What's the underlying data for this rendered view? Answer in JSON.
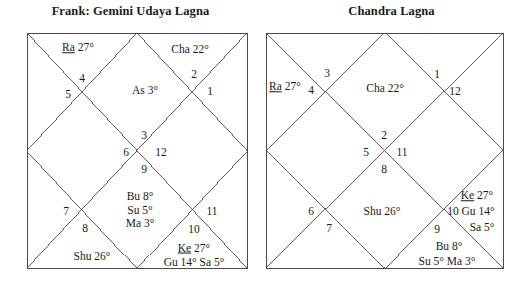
{
  "page": {
    "background": "#ffffff",
    "line_color": "#4a4a4a",
    "text_color": "#1a1a1a"
  },
  "charts": [
    {
      "id": "frank-gemini-udaya-lagna",
      "title": "Frank: Gemini Udaya Lagna",
      "box": {
        "x": 27,
        "y": 33,
        "w": 220,
        "h": 235
      },
      "house_numbers": [
        {
          "n": "4",
          "x": 82,
          "y": 78
        },
        {
          "n": "5",
          "x": 68,
          "y": 94
        },
        {
          "n": "2",
          "x": 194,
          "y": 74
        },
        {
          "n": "1",
          "x": 210,
          "y": 91
        },
        {
          "n": "3",
          "x": 144,
          "y": 135
        },
        {
          "n": "6",
          "x": 126,
          "y": 152
        },
        {
          "n": "12",
          "x": 161,
          "y": 152
        },
        {
          "n": "9",
          "x": 144,
          "y": 169
        },
        {
          "n": "7",
          "x": 66,
          "y": 211
        },
        {
          "n": "8",
          "x": 85,
          "y": 228
        },
        {
          "n": "11",
          "x": 212,
          "y": 211
        },
        {
          "n": "10",
          "x": 194,
          "y": 229
        }
      ],
      "planet_labels": [
        {
          "key": "ra",
          "lines": [
            "Ra 27°"
          ],
          "underline_first_word": true,
          "x": 78,
          "y": 48,
          "align": "center"
        },
        {
          "key": "cha",
          "lines": [
            "Cha 22°"
          ],
          "underline_first_word": false,
          "x": 190,
          "y": 50,
          "align": "center"
        },
        {
          "key": "as",
          "lines": [
            "As 3°"
          ],
          "underline_first_word": false,
          "x": 145,
          "y": 91,
          "align": "center"
        },
        {
          "key": "bu_su_ma",
          "lines": [
            "Bu 8°",
            "Su 5°",
            "Ma 3°"
          ],
          "underline_first_word": false,
          "x": 140,
          "y": 210,
          "align": "center"
        },
        {
          "key": "shu",
          "lines": [
            "Shu 26°"
          ],
          "underline_first_word": false,
          "x": 92,
          "y": 257,
          "align": "center"
        },
        {
          "key": "ke_gu_sa",
          "lines": [
            "Ke 27°",
            "Gu 14° Sa 5°"
          ],
          "underline_first_word": true,
          "x": 194,
          "y": 255,
          "align": "center"
        }
      ]
    },
    {
      "id": "chandra-lagna",
      "title": "Chandra Lagna",
      "box": {
        "x": 5,
        "y": 33,
        "w": 237,
        "h": 235
      },
      "house_numbers": [
        {
          "n": "3",
          "x": 66,
          "y": 73
        },
        {
          "n": "4",
          "x": 50,
          "y": 90
        },
        {
          "n": "1",
          "x": 176,
          "y": 74
        },
        {
          "n": "12",
          "x": 194,
          "y": 91
        },
        {
          "n": "2",
          "x": 123,
          "y": 135
        },
        {
          "n": "5",
          "x": 105,
          "y": 152
        },
        {
          "n": "11",
          "x": 141,
          "y": 152
        },
        {
          "n": "8",
          "x": 123,
          "y": 169
        },
        {
          "n": "6",
          "x": 50,
          "y": 211
        },
        {
          "n": "7",
          "x": 68,
          "y": 228
        },
        {
          "n": "10",
          "x": 192,
          "y": 211
        },
        {
          "n": "9",
          "x": 176,
          "y": 229
        }
      ],
      "planet_labels": [
        {
          "key": "ra",
          "lines": [
            "Ra 27°"
          ],
          "underline_first_word": true,
          "x": 8,
          "y": 87,
          "align": "left"
        },
        {
          "key": "cha",
          "lines": [
            "Cha 22°"
          ],
          "underline_first_word": false,
          "x": 124,
          "y": 89,
          "align": "center"
        },
        {
          "key": "shu",
          "lines": [
            "Shu 26°"
          ],
          "underline_first_word": false,
          "x": 121,
          "y": 212,
          "align": "center"
        },
        {
          "key": "ke",
          "lines": [
            "Ke 27°"
          ],
          "underline_first_word": true,
          "x": 216,
          "y": 196,
          "align": "center"
        },
        {
          "key": "gu",
          "lines": [
            "Gu 14°"
          ],
          "underline_first_word": false,
          "x": 217,
          "y": 212,
          "align": "center"
        },
        {
          "key": "sa",
          "lines": [
            "Sa 5°"
          ],
          "underline_first_word": false,
          "x": 221,
          "y": 228,
          "align": "center"
        },
        {
          "key": "bu",
          "lines": [
            "Bu 8°"
          ],
          "underline_first_word": false,
          "x": 188,
          "y": 247,
          "align": "center"
        },
        {
          "key": "su_ma",
          "lines": [
            "Su 5° Ma 3°"
          ],
          "underline_first_word": false,
          "x": 186,
          "y": 262,
          "align": "center"
        }
      ]
    }
  ]
}
